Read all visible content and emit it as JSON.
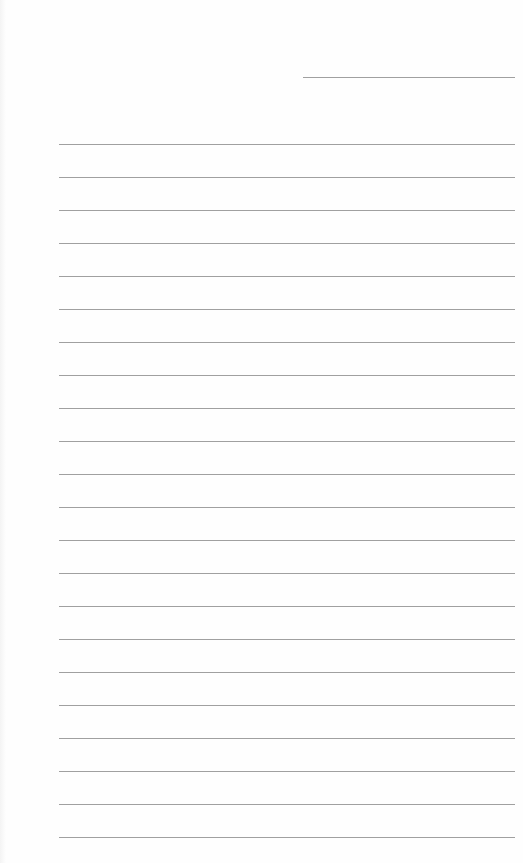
{
  "page": {
    "type": "lined-paper",
    "line_color": "#a0a0a0",
    "header_rule": {
      "x": 303,
      "y": 77,
      "width": 212
    },
    "ruled_lines": {
      "count": 22,
      "start_y": 144,
      "spacing": 33,
      "x": 59,
      "width": 456
    }
  }
}
